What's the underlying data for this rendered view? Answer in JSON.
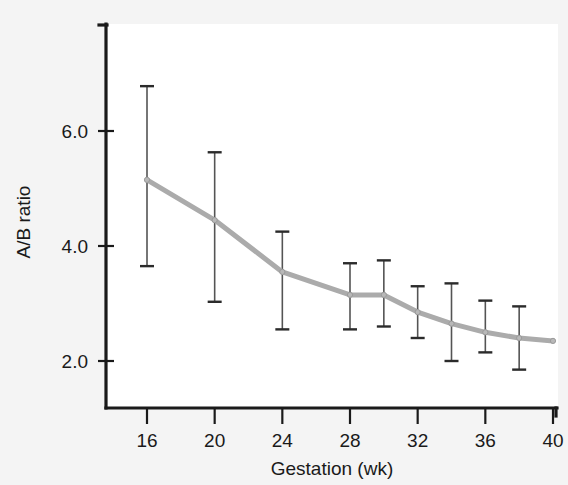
{
  "chart_data": {
    "type": "line",
    "title": "",
    "subtitle": "",
    "xlabel": "Gestation (wk)",
    "ylabel": "A/B ratio",
    "xlim": [
      14,
      41
    ],
    "ylim": [
      1.2,
      7.3
    ],
    "xticks": [
      16,
      20,
      24,
      28,
      32,
      36,
      40
    ],
    "xtick_labels": [
      "16",
      "20",
      "24",
      "28",
      "32",
      "36",
      "40"
    ],
    "yticks": [
      2.0,
      4.0,
      6.0
    ],
    "ytick_labels": [
      "2.0",
      "4.0",
      "6.0"
    ],
    "grid": false,
    "legend": null,
    "error_bar_type": "range",
    "x": [
      16,
      20,
      24,
      28,
      30,
      32,
      34,
      36,
      38,
      40
    ],
    "series": [
      {
        "name": "A/B ratio",
        "values": [
          5.15,
          4.45,
          3.55,
          3.15,
          3.15,
          2.85,
          2.65,
          2.5,
          2.4,
          2.35
        ],
        "err_low": [
          3.65,
          3.03,
          2.55,
          2.55,
          2.6,
          2.4,
          2.0,
          2.15,
          1.85,
          null
        ],
        "err_high": [
          6.78,
          5.63,
          4.25,
          3.7,
          3.75,
          3.3,
          3.35,
          3.05,
          2.95,
          null
        ],
        "line_color": "#ababab",
        "marker_color": "#b8b8b8",
        "error_color": "#545454"
      }
    ],
    "annotations": []
  },
  "figure": {
    "background_color": "#f4f4f4",
    "plot_background_color": "#ffffff",
    "axis_color": "#1a1a1a"
  }
}
